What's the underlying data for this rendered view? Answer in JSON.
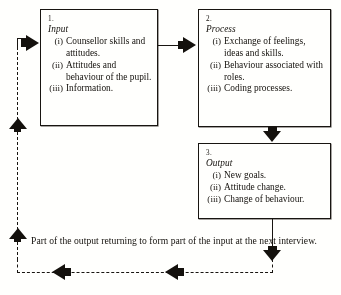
{
  "diagram": {
    "type": "flow-cycle",
    "caption": "Part of the output returning to form part of the input at the next interview.",
    "boxes": [
      {
        "number": "1.",
        "title": "Input",
        "items": [
          {
            "marker": "(i)",
            "text": "Counsellor skills and attitudes."
          },
          {
            "marker": "(ii)",
            "text": "Attitudes and behaviour of the pupil."
          },
          {
            "marker": "(iii)",
            "text": "Information."
          }
        ]
      },
      {
        "number": "2.",
        "title": "Process",
        "items": [
          {
            "marker": "(i)",
            "text": "Exchange of feelings, ideas  and skills."
          },
          {
            "marker": "(ii)",
            "text": "Behaviour associated with roles."
          },
          {
            "marker": "(iii)",
            "text": "Coding processes."
          }
        ]
      },
      {
        "number": "3.",
        "title": "Output",
        "items": [
          {
            "marker": "(i)",
            "text": "New goals."
          },
          {
            "marker": "(ii)",
            "text": "Attitude change."
          },
          {
            "marker": "(iii)",
            "text": "Change of behaviour."
          }
        ]
      }
    ],
    "connectors": [
      {
        "name": "input-to-process",
        "style": "solid",
        "direction": "right"
      },
      {
        "name": "process-to-output",
        "style": "solid",
        "direction": "down"
      },
      {
        "name": "output-to-feedback",
        "style": "solid",
        "direction": "down"
      },
      {
        "name": "feedback-bottom",
        "style": "dashed",
        "direction": "left"
      },
      {
        "name": "feedback-left",
        "style": "dashed",
        "direction": "up"
      },
      {
        "name": "feedback-into-input",
        "style": "solid",
        "direction": "right"
      }
    ],
    "colors": {
      "ink": "#16130f",
      "paper": "#fdfdfb"
    }
  }
}
